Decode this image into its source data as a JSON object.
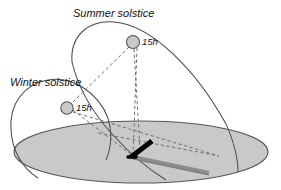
{
  "figure": {
    "type": "astronomical-diagram",
    "background_color": "#ffffff"
  },
  "labels": {
    "summer_solstice": "Summer solstice",
    "winter_solstice": "Winter solstice",
    "summer_hour_marker": "15h",
    "winter_hour_marker": "15h"
  },
  "colors": {
    "stroke": "#3a3a3a",
    "ground_fill": "#c9c9c9",
    "ground_stroke": "#555555",
    "sun_fill": "#c9c9c9",
    "sun_stroke": "#555555",
    "gnomon": "#000000",
    "shadow": "#8c8c8c",
    "dashed": "#6e6e6e"
  },
  "geometry": {
    "ground_plane": {
      "center_x": 141,
      "center_y": 152,
      "radius_x": 127,
      "radius_y": 31
    },
    "summer_path": {
      "note": "large tilted ellipse arc — summer solstice diurnal path",
      "center_x": 150,
      "center_y": 92,
      "radius_x": 86,
      "radius_y": 68,
      "rotation_deg": -28
    },
    "winter_path": {
      "note": "small tilted ellipse arc — winter solstice diurnal path",
      "center_x": 62,
      "center_y": 123,
      "radius_x": 52,
      "radius_y": 40,
      "rotation_deg": -28
    },
    "summer_sun": {
      "x": 133,
      "y": 42,
      "r": 6.5
    },
    "winter_sun": {
      "x": 67,
      "y": 108,
      "r": 6.2
    },
    "gnomon": {
      "tip_x": 152,
      "tip_y": 141,
      "base_x": 131,
      "base_y": 157
    },
    "shadow": {
      "from_x": 133,
      "from_y": 157,
      "to_x": 209,
      "to_y": 173
    },
    "nadir_foot": {
      "x": 140,
      "y": 150
    }
  }
}
